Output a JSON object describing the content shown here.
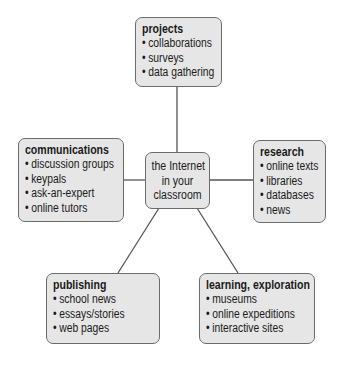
{
  "diagram": {
    "center": {
      "lines": [
        "the Internet",
        "in your",
        "classroom"
      ]
    },
    "nodes": {
      "projects": {
        "title": "projects",
        "items": [
          "collaborations",
          "surveys",
          "data gathering"
        ]
      },
      "communications": {
        "title": "communications",
        "items": [
          "discussion groups",
          "keypals",
          "ask-an-expert",
          "online tutors"
        ]
      },
      "research": {
        "title": "research",
        "items": [
          "online texts",
          "libraries",
          "databases",
          "news"
        ]
      },
      "publishing": {
        "title": "publishing",
        "items": [
          "school news",
          "essays/stories",
          "web pages"
        ]
      },
      "learning": {
        "title": "learning, exploration",
        "items": [
          "museums",
          "online expeditions",
          "interactive sites"
        ]
      }
    },
    "colors": {
      "box_fill": "#e6e6e6",
      "box_border": "#6b6b6b",
      "line": "#555555"
    }
  }
}
